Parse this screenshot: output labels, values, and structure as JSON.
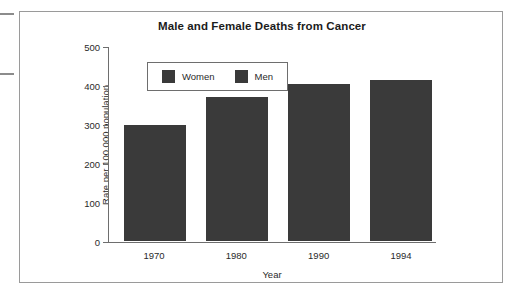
{
  "page": {
    "margin_marks": [
      "scan-mark-top",
      "scan-mark-bottom"
    ]
  },
  "chart_data": {
    "type": "bar",
    "title": "Male and Female Deaths from Cancer",
    "categories": [
      "1970",
      "1980",
      "1990",
      "1994"
    ],
    "values": [
      300,
      370,
      405,
      415
    ],
    "xlabel": "Year",
    "ylabel": "Rate per 100,000 population",
    "ylim": [
      0,
      500
    ],
    "yticks": [
      0,
      100,
      200,
      300,
      400,
      500
    ],
    "ytick_labels": [
      "0",
      "100",
      "200",
      "300",
      "400",
      "500"
    ],
    "grid": false,
    "legend_position": "upper-left-inside",
    "legend": [
      {
        "name": "Women",
        "color": "#3a3a3a"
      },
      {
        "name": "Men",
        "color": "#3a3a3a"
      }
    ],
    "series": [
      {
        "name": "Total",
        "values": [
          300,
          370,
          405,
          415
        ],
        "color": "#3a3a3a"
      }
    ]
  }
}
